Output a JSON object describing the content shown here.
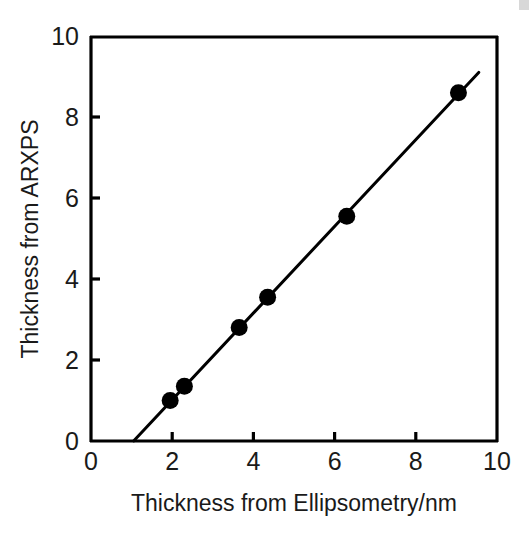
{
  "chart_data": {
    "type": "scatter",
    "title": "",
    "subtitle": "",
    "xlabel": "Thickness from Ellipsometry/nm",
    "ylabel": "Thickness from ARXPS",
    "xlim": [
      0,
      10
    ],
    "ylim": [
      0,
      10
    ],
    "xticks": [
      0,
      2,
      4,
      6,
      8,
      10
    ],
    "yticks": [
      0,
      2,
      4,
      6,
      8,
      10
    ],
    "xtick_labels": [
      "0",
      "2",
      "4",
      "6",
      "8",
      "10"
    ],
    "ytick_labels": [
      "0",
      "2",
      "4",
      "6",
      "8",
      "10"
    ],
    "grid": false,
    "legend": false,
    "legend_position": "none",
    "marker": "filled-circle",
    "marker_color": "#000000",
    "marker_size_px": 17,
    "line_color": "#000000",
    "line_width_px": 3,
    "axis_color": "#000000",
    "background_color": "#ffffff",
    "series": [
      {
        "name": "ARXPS vs Ellipsometry",
        "points": [
          {
            "x": 1.95,
            "y": 1.0
          },
          {
            "x": 2.3,
            "y": 1.35
          },
          {
            "x": 3.65,
            "y": 2.8
          },
          {
            "x": 4.35,
            "y": 3.55
          },
          {
            "x": 6.3,
            "y": 5.55
          },
          {
            "x": 9.05,
            "y": 8.6
          }
        ]
      }
    ],
    "fit_line": {
      "name": "linear fit",
      "x_start": 1.05,
      "y_start": 0.0,
      "x_end": 9.55,
      "y_end": 9.1
    }
  },
  "axes": {
    "x_title": "Thickness from Ellipsometry/nm",
    "y_title": "Thickness from ARXPS"
  }
}
